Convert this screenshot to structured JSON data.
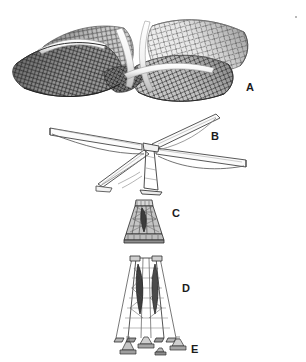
{
  "figure": {
    "kind": "structural-model-photo-plate",
    "background_color": "#ffffff",
    "ink_color": "#1c1c1c",
    "width": 306,
    "height": 362,
    "panels": [
      {
        "id": "A",
        "label": "A",
        "label_x": 246,
        "label_y": 82,
        "caption": "hyperbolic-paraboloid mesh roof model",
        "render": "mesh-roof",
        "description": "Four saddle-shaped lattice-mesh shells meeting at a central high point, photographed model, grey tones",
        "mesh_tone_light": "#e8e8e8",
        "mesh_tone_mid": "#9a9a9a",
        "mesh_tone_dark": "#4a4a4a"
      },
      {
        "id": "B",
        "label": "B",
        "label_x": 211,
        "label_y": 131,
        "caption": "cruciform cantilever frame line drawing",
        "render": "frame-drawing",
        "description": "Tapered cantilever beams radiating from a central column with curved haunch struts beneath",
        "line_color": "#3a3a3a"
      },
      {
        "id": "C",
        "label": "C",
        "label_x": 172,
        "label_y": 208,
        "caption": "column capital detail",
        "render": "capital-detail",
        "description": "Short flared lattice column head, dark hatched",
        "line_color": "#2a2a2a"
      },
      {
        "id": "D",
        "label": "D",
        "label_x": 182,
        "label_y": 283,
        "caption": "tapered lattice mast",
        "render": "lattice-mast",
        "description": "Tall trapezoidal braced tower with paired diagonal web members, splaying legs",
        "line_color": "#2a2a2a"
      },
      {
        "id": "E",
        "label": "E",
        "label_x": 191,
        "label_y": 344,
        "caption": "base footing details",
        "render": "footings",
        "description": "Row of small splayed base shoe / anchor footing pieces",
        "line_color": "#2a2a2a"
      }
    ]
  }
}
